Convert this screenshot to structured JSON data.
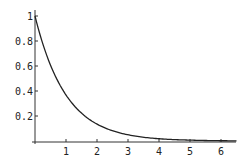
{
  "chart_data": {
    "type": "line",
    "title": "",
    "xlabel": "",
    "ylabel": "",
    "xlim": [
      0,
      6.5
    ],
    "ylim": [
      0,
      1
    ],
    "grid": false,
    "legend": null,
    "x_ticks": [
      "1",
      "2",
      "3",
      "4",
      "5",
      "6"
    ],
    "y_ticks": [
      "0.2",
      "0.4",
      "0.6",
      "0.8",
      "1"
    ],
    "series": [
      {
        "name": "exp(-x)",
        "x": [
          0,
          0.5,
          1,
          1.5,
          2,
          2.5,
          3,
          3.5,
          4,
          4.5,
          5,
          5.5,
          6,
          6.5
        ],
        "values": [
          1.0,
          0.607,
          0.368,
          0.223,
          0.135,
          0.082,
          0.05,
          0.03,
          0.018,
          0.011,
          0.007,
          0.004,
          0.002,
          0.0015
        ]
      }
    ]
  },
  "colors": {
    "line": "#222222",
    "axis": "#333333",
    "background": "#ffffff"
  }
}
